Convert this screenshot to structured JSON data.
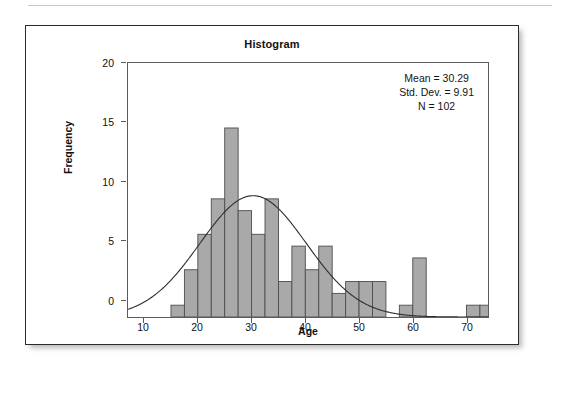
{
  "figure": {
    "title": "Histogram",
    "top_rule": "divider"
  },
  "stats": {
    "mean": "Mean = 30.29",
    "std_dev": "Std. Dev. = 9.91",
    "n": "N = 102"
  },
  "axes": {
    "xlabel": "Age",
    "ylabel": "Frequency",
    "x_ticks": [
      "10",
      "20",
      "30",
      "40",
      "50",
      "60",
      "70"
    ],
    "y_ticks": [
      "0",
      "5",
      "10",
      "15",
      "20"
    ]
  },
  "colors": {
    "bar_fill": "#a9a9a9",
    "bar_stroke": "#4d4d4d",
    "curve": "#2e2e2e",
    "axis": "#5c5c5c",
    "frame": "#2b2b2b",
    "text": "#111111"
  },
  "chart_data": {
    "type": "bar",
    "title": "Histogram",
    "xlabel": "Age",
    "ylabel": "Frequency",
    "xlim": [
      7,
      74
    ],
    "ylim": [
      0,
      21.5
    ],
    "grid": false,
    "legend": null,
    "bin_width": 2.5,
    "annotations": [
      "Mean = 30.29",
      "Std. Dev. = 9.91",
      "N = 102"
    ],
    "overlay": {
      "type": "normal-curve",
      "mean": 30.29,
      "std_dev": 9.91,
      "n": 102,
      "bin_width": 2.5,
      "peak_value": 10.3
    },
    "bins": [
      {
        "x0": 15.0,
        "x1": 17.5,
        "center": 16.25,
        "value": 1
      },
      {
        "x0": 17.5,
        "x1": 20.0,
        "center": 18.75,
        "value": 4
      },
      {
        "x0": 20.0,
        "x1": 22.5,
        "center": 21.25,
        "value": 7
      },
      {
        "x0": 22.5,
        "x1": 25.0,
        "center": 23.75,
        "value": 10
      },
      {
        "x0": 25.0,
        "x1": 27.5,
        "center": 26.25,
        "value": 16
      },
      {
        "x0": 27.5,
        "x1": 30.0,
        "center": 28.75,
        "value": 9
      },
      {
        "x0": 30.0,
        "x1": 32.5,
        "center": 31.25,
        "value": 7
      },
      {
        "x0": 32.5,
        "x1": 35.0,
        "center": 33.75,
        "value": 10
      },
      {
        "x0": 35.0,
        "x1": 37.5,
        "center": 36.25,
        "value": 3
      },
      {
        "x0": 37.5,
        "x1": 40.0,
        "center": 38.75,
        "value": 6
      },
      {
        "x0": 40.0,
        "x1": 42.5,
        "center": 41.25,
        "value": 4
      },
      {
        "x0": 42.5,
        "x1": 45.0,
        "center": 43.75,
        "value": 6
      },
      {
        "x0": 45.0,
        "x1": 47.5,
        "center": 46.25,
        "value": 2
      },
      {
        "x0": 47.5,
        "x1": 50.0,
        "center": 48.75,
        "value": 3
      },
      {
        "x0": 50.0,
        "x1": 52.5,
        "center": 51.25,
        "value": 3
      },
      {
        "x0": 52.5,
        "x1": 55.0,
        "center": 53.75,
        "value": 3
      },
      {
        "x0": 57.5,
        "x1": 60.0,
        "center": 58.75,
        "value": 1
      },
      {
        "x0": 60.0,
        "x1": 62.5,
        "center": 61.25,
        "value": 5
      },
      {
        "x0": 70.0,
        "x1": 72.5,
        "center": 71.25,
        "value": 1
      },
      {
        "x0": 72.5,
        "x1": 75.0,
        "center": 73.75,
        "value": 1
      }
    ],
    "categories": [
      16.25,
      18.75,
      21.25,
      23.75,
      26.25,
      28.75,
      31.25,
      33.75,
      36.25,
      38.75,
      41.25,
      43.75,
      46.25,
      48.75,
      51.25,
      53.75,
      58.75,
      61.25,
      71.25,
      73.75
    ],
    "values": [
      1,
      4,
      7,
      10,
      16,
      9,
      7,
      10,
      3,
      6,
      4,
      6,
      2,
      3,
      3,
      3,
      1,
      5,
      1,
      1
    ]
  }
}
